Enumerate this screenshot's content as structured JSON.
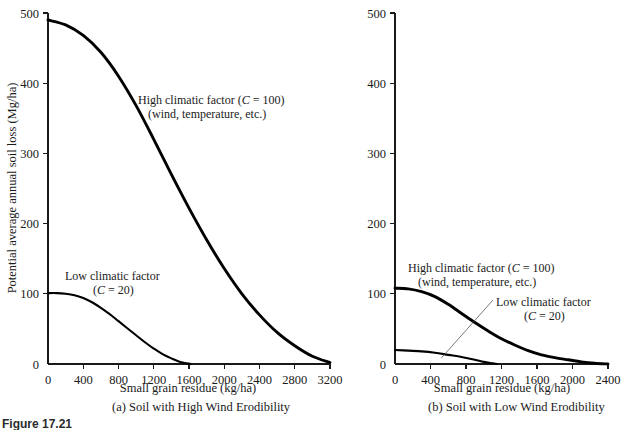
{
  "figure": {
    "number_label": "Figure 17.21",
    "panel_a_caption": "(a)  Soil with High Wind Erodibility",
    "panel_b_caption": "(b)  Soil with Low Wind Erodibility"
  },
  "chart_data": [
    {
      "id": "panel-a",
      "type": "line",
      "title": "(a)  Soil with High Wind Erodibility",
      "xlabel": "Small grain residue (kg/ha)",
      "ylabel": "Potential average annual soil loss (Mg/ha)",
      "xlim": [
        0,
        3200
      ],
      "ylim": [
        0,
        500
      ],
      "xticks": [
        0,
        400,
        800,
        1200,
        1600,
        2000,
        2400,
        2800,
        3200
      ],
      "xtick_labels": [
        "0",
        "400",
        "800",
        "1200",
        "1600",
        "2000",
        "2400",
        "2800",
        "3200"
      ],
      "yticks": [
        0,
        100,
        200,
        300,
        400,
        500
      ],
      "ytick_labels": [
        "0",
        "100",
        "200",
        "300",
        "400",
        "500"
      ],
      "grid": false,
      "legend_position": "inline-annotation",
      "series": [
        {
          "name": "High climatic factor (C = 100)",
          "annotation_line1": "High climatic factor (C = 100)",
          "annotation_line2": "(wind, temperature, etc.)",
          "x": [
            0,
            200,
            400,
            600,
            800,
            1000,
            1200,
            1400,
            1600,
            1800,
            2000,
            2200,
            2400,
            2600,
            2800,
            3000,
            3200
          ],
          "values": [
            490,
            483,
            468,
            444,
            410,
            368,
            320,
            270,
            222,
            177,
            136,
            100,
            70,
            45,
            26,
            11,
            2
          ]
        },
        {
          "name": "Low climatic factor (C = 20)",
          "annotation_line1": "Low climatic factor",
          "annotation_line2": "(C = 20)",
          "x": [
            0,
            100,
            200,
            300,
            400,
            500,
            600,
            700,
            800,
            900,
            1000,
            1100,
            1200,
            1300,
            1400,
            1500,
            1620
          ],
          "values": [
            101,
            101,
            100,
            98,
            94,
            88,
            80,
            71,
            61,
            51,
            41,
            31,
            22,
            14,
            8,
            3,
            0
          ]
        }
      ]
    },
    {
      "id": "panel-b",
      "type": "line",
      "title": "(b)  Soil with Low Wind Erodibility",
      "xlabel": "Small grain residue (kg/ha)",
      "ylabel": "",
      "xlim": [
        0,
        2400
      ],
      "ylim": [
        0,
        500
      ],
      "xticks": [
        0,
        400,
        800,
        1200,
        1600,
        2000,
        2400
      ],
      "xtick_labels": [
        "0",
        "400",
        "800",
        "1200",
        "1600",
        "2000",
        "2400"
      ],
      "yticks": [
        0,
        100,
        200,
        300,
        400,
        500
      ],
      "ytick_labels": [
        "0",
        "100",
        "200",
        "300",
        "400",
        "500"
      ],
      "grid": false,
      "legend_position": "inline-annotation",
      "series": [
        {
          "name": "High climatic factor (C = 100)",
          "annotation_line1": "High climatic factor (C = 100)",
          "annotation_line2": "(wind, temperature, etc.)",
          "x": [
            0,
            150,
            300,
            450,
            600,
            750,
            900,
            1050,
            1200,
            1350,
            1500,
            1650,
            1800,
            1950,
            2100,
            2250,
            2400
          ],
          "values": [
            108,
            107,
            103,
            96,
            85,
            72,
            59,
            47,
            36,
            27,
            19,
            13,
            9,
            6,
            3,
            1,
            0
          ]
        },
        {
          "name": "Low climatic factor (C = 20)",
          "annotation_line1": "Low climatic factor",
          "annotation_line2": "(C = 20)",
          "x": [
            0,
            150,
            300,
            450,
            600,
            750,
            900,
            1000,
            1100,
            1150
          ],
          "values": [
            20,
            19,
            18,
            16,
            13,
            10,
            6,
            3,
            1,
            0
          ]
        }
      ]
    }
  ],
  "panel_a": {
    "ylabel": "Potential average annual soil loss (Mg/ha)",
    "xlabel": "Small grain residue (kg/ha)",
    "xtick_labels": [
      "0",
      "400",
      "800",
      "1200",
      "1600",
      "2000",
      "2400",
      "2800",
      "3200"
    ],
    "ytick_labels": [
      "0",
      "100",
      "200",
      "300",
      "400",
      "500"
    ],
    "annotations": {
      "high_l1_a": "High climatic factor (",
      "high_l1_c": "C",
      "high_l1_b": " = 100)",
      "high_l2": "(wind, temperature, etc.)",
      "low_l1": "Low climatic factor",
      "low_l2_a": "(",
      "low_l2_c": "C",
      "low_l2_b": " = 20)"
    }
  },
  "panel_b": {
    "xlabel": "Small grain residue (kg/ha)",
    "xtick_labels": [
      "0",
      "400",
      "800",
      "1200",
      "1600",
      "2000",
      "2400"
    ],
    "ytick_labels": [
      "0",
      "100",
      "200",
      "300",
      "400",
      "500"
    ],
    "annotations": {
      "high_l1_a": "High climatic factor (",
      "high_l1_c": "C",
      "high_l1_b": " = 100)",
      "high_l2": "(wind, temperature, etc.)",
      "low_l1": "Low climatic factor",
      "low_l2_a": "(",
      "low_l2_c": "C",
      "low_l2_b": " = 20)"
    }
  }
}
